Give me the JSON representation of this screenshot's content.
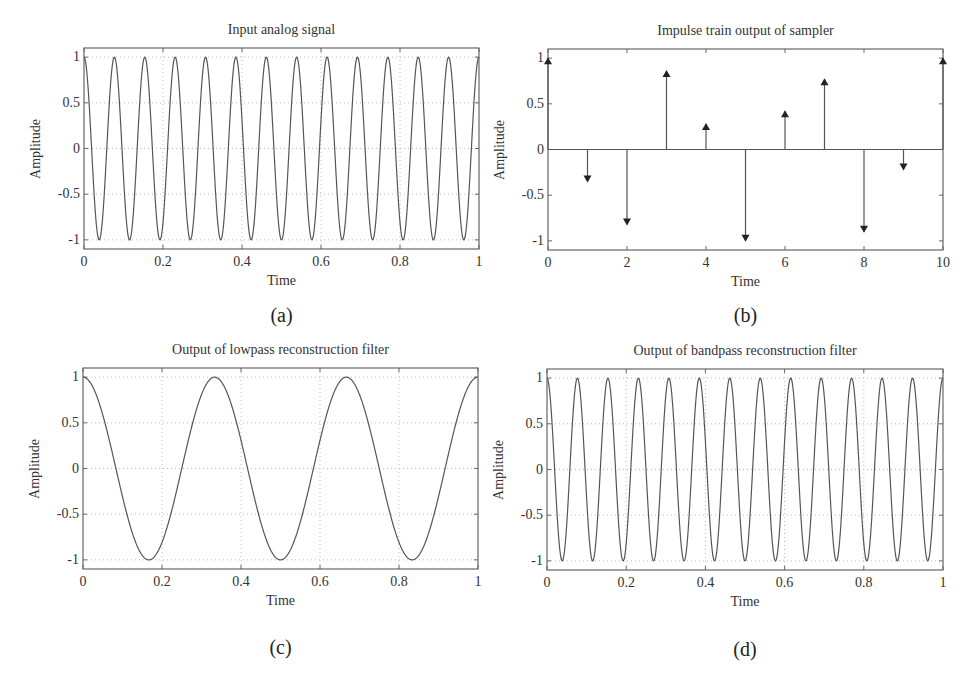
{
  "figure": {
    "background": "#ffffff",
    "line_color": "#555555",
    "grid_color": "#bbbbbb",
    "axis_color": "#666666"
  },
  "chart_data": [
    {
      "id": "a",
      "type": "line",
      "title": "Input analog signal",
      "xlabel": "Time",
      "ylabel": "Amplitude",
      "caption": "(a)",
      "xlim": [
        0,
        1
      ],
      "ylim": [
        -1.1,
        1.1
      ],
      "xticks": [
        0,
        0.2,
        0.4,
        0.6,
        0.8,
        1
      ],
      "xtick_labels": [
        "0",
        "0.2",
        "0.4",
        "0.6",
        "0.8",
        "1"
      ],
      "yticks": [
        1,
        0.5,
        0,
        -0.5,
        -1
      ],
      "ytick_labels": [
        "1",
        "0.5",
        "0",
        "-0.5",
        "-1"
      ],
      "grid": true,
      "function": "cos(2*pi*f*t)",
      "frequency_hz": 13,
      "amplitude": 1
    },
    {
      "id": "b",
      "type": "stem",
      "title": "Impulse train output of sampler",
      "xlabel": "Time",
      "ylabel": "Amplitude",
      "caption": "(b)",
      "xlim": [
        0,
        10
      ],
      "ylim": [
        -1.1,
        1.1
      ],
      "xticks": [
        0,
        2,
        4,
        6,
        8,
        10
      ],
      "xtick_labels": [
        "0",
        "2",
        "4",
        "6",
        "8",
        "10"
      ],
      "yticks": [
        1,
        0.5,
        0,
        -0.5,
        -1
      ],
      "ytick_labels": [
        "1",
        "0.5",
        "0",
        "-0.5",
        "-1"
      ],
      "grid": false,
      "marker": "arrow",
      "x": [
        0,
        1,
        2,
        3,
        4,
        5,
        6,
        7,
        8,
        9,
        10
      ],
      "values": [
        1.0,
        -0.35,
        -0.82,
        0.86,
        0.28,
        -1.0,
        0.42,
        0.77,
        -0.9,
        -0.22,
        1.0
      ]
    },
    {
      "id": "c",
      "type": "line",
      "title": "Output of lowpass reconstruction filter",
      "xlabel": "Time",
      "ylabel": "Amplitude",
      "caption": "(c)",
      "xlim": [
        0,
        1
      ],
      "ylim": [
        -1.1,
        1.1
      ],
      "xticks": [
        0,
        0.2,
        0.4,
        0.6,
        0.8,
        1
      ],
      "xtick_labels": [
        "0",
        "0.2",
        "0.4",
        "0.6",
        "0.8",
        "1"
      ],
      "yticks": [
        1,
        0.5,
        0,
        -0.5,
        -1
      ],
      "ytick_labels": [
        "1",
        "0.5",
        "0",
        "-0.5",
        "-1"
      ],
      "grid": true,
      "function": "cos(2*pi*f*t)",
      "frequency_hz": 3,
      "amplitude": 1
    },
    {
      "id": "d",
      "type": "line",
      "title": "Output of bandpass reconstruction filter",
      "xlabel": "Time",
      "ylabel": "Amplitude",
      "caption": "(d)",
      "xlim": [
        0,
        1
      ],
      "ylim": [
        -1.1,
        1.1
      ],
      "xticks": [
        0,
        0.2,
        0.4,
        0.6,
        0.8,
        1
      ],
      "xtick_labels": [
        "0",
        "0.2",
        "0.4",
        "0.6",
        "0.8",
        "1"
      ],
      "yticks": [
        1,
        0.5,
        0,
        -0.5,
        -1
      ],
      "ytick_labels": [
        "1",
        "0.5",
        "0",
        "-0.5",
        "-1"
      ],
      "grid": true,
      "function": "cos(2*pi*f*t)",
      "frequency_hz": 13,
      "amplitude": 1
    }
  ]
}
